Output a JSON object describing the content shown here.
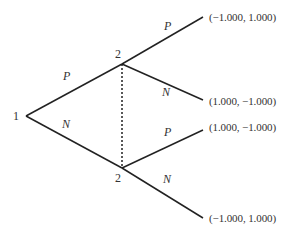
{
  "diagram": {
    "type": "game-tree",
    "nodes": {
      "root": {
        "label": "1",
        "x": 26,
        "y": 116
      },
      "upper": {
        "label": "2",
        "x": 122,
        "y": 64
      },
      "lower": {
        "label": "2",
        "x": 122,
        "y": 168
      }
    },
    "actions": {
      "root_up": "P",
      "root_down": "N",
      "upper_up": "P",
      "upper_down": "N",
      "lower_up": "P",
      "lower_down": "N"
    },
    "payoffs": {
      "upper_P": "(−1.000, 1.000)",
      "upper_N": "(1.000, −1.000)",
      "lower_P": "(1.000, −1.000)",
      "lower_N": "(−1.000, 1.000)"
    },
    "information_set": "dotted line connecting both player-2 nodes",
    "colors": {
      "line": "#222222",
      "text": "#333333"
    }
  }
}
